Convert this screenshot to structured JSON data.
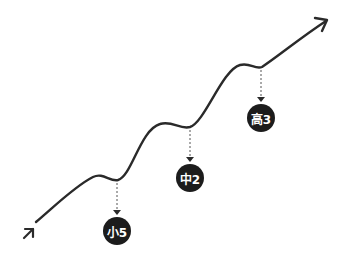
{
  "diagram": {
    "type": "rising-wavy-arrow",
    "line_color": "#2a2a2a",
    "badge_color": "#1c1c1c",
    "badge_text_color": "#ffffff",
    "milestones": [
      {
        "label": "小5",
        "meaning": "elementary 5th grade"
      },
      {
        "label": "中2",
        "meaning": "middle school 2nd year"
      },
      {
        "label": "高3",
        "meaning": "high school 3rd year"
      }
    ]
  }
}
